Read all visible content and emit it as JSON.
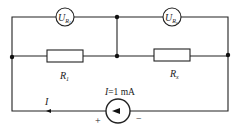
{
  "diagram": {
    "type": "circuit",
    "meters": [
      {
        "id": "voltmeter-1",
        "symbol": "U",
        "subscript": "R",
        "subsub": "1"
      },
      {
        "id": "voltmeter-x",
        "symbol": "U",
        "subscript": "R",
        "subsub": "x"
      }
    ],
    "resistors": [
      {
        "id": "R1",
        "symbol": "R",
        "subscript": "1"
      },
      {
        "id": "Rx",
        "symbol": "R",
        "subscript": "x"
      }
    ],
    "source": {
      "label_var": "I",
      "label_value": "=1 mA",
      "plus": "+",
      "minus": "−"
    },
    "current_label": "I",
    "colors": {
      "wire": "#222222",
      "background": "#ffffff"
    }
  }
}
